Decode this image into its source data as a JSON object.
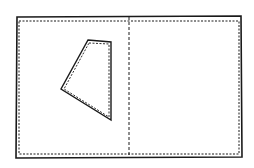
{
  "diagram": {
    "colors": {
      "stroke": "#1a1a1a",
      "background": "#ffffff"
    },
    "outer_rect": {
      "x": 16,
      "y": 17,
      "w": 226,
      "h": 141
    },
    "fold_line_x": 129,
    "patch_points": "88,40 111,42 111,120 61,89"
  }
}
